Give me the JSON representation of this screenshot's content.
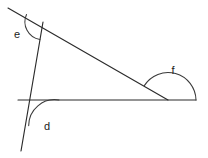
{
  "figure": {
    "background_color": "#ffffff",
    "line_color": "#2b2b2b",
    "arc_color": "#3a3a3a",
    "label_color": "#1a1a1a"
  },
  "labels": {
    "e": "e",
    "d": "d",
    "f": "f"
  },
  "label_positions": {
    "e": {
      "x": 17,
      "y": 35
    },
    "d": {
      "x": 47,
      "y": 127
    },
    "f": {
      "x": 173,
      "y": 71
    }
  },
  "lines": [
    {
      "name": "diagonal-line",
      "description": "long diagonal from upper-left to lower-right meeting the horizontal",
      "x1": 8,
      "y1": 8,
      "x2": 168,
      "y2": 100
    },
    {
      "name": "steep-line",
      "description": "steep near-vertical line crossing the diagonal at top and the horizontal at bottom",
      "x1": 43,
      "y1": 22,
      "x2": 21,
      "y2": 151
    },
    {
      "name": "horizontal-line",
      "description": "horizontal base line running to the right edge",
      "x1": 18,
      "y1": 100,
      "x2": 196,
      "y2": 100
    }
  ],
  "vertices": {
    "e_vertex": {
      "x": 43,
      "y": 22
    },
    "d_vertex": {
      "x": 33,
      "y": 100
    },
    "f_vertex": {
      "x": 168,
      "y": 100
    }
  },
  "arcs": [
    {
      "name": "angle-arc-e",
      "label": "e",
      "vertex_x": 43,
      "vertex_y": 22,
      "radius": 18,
      "path": "M 26.5 14.5 A 18 18 0 0 0 39.9 39.6"
    },
    {
      "name": "angle-arc-d",
      "label": "d",
      "vertex_x": 33,
      "vertex_y": 100,
      "radius": 26,
      "path": "M 59 100 A 26 26 0 0 0 28.7 125.6"
    },
    {
      "name": "angle-arc-f",
      "label": "f",
      "vertex_x": 168,
      "vertex_y": 100,
      "radius": 28,
      "path": "M 196 100 A 28 28 0 0 0 144.3 85.6"
    }
  ]
}
